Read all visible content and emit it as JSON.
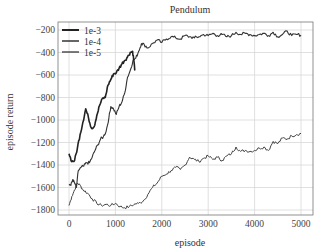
{
  "chart_data": {
    "type": "line",
    "title": "Pendulum",
    "xlabel": "episode",
    "ylabel": "episode return",
    "xlim": [
      -200,
      5300
    ],
    "ylim": [
      -1880,
      -150
    ],
    "xticks": [
      0,
      1000,
      2000,
      3000,
      4000,
      5000
    ],
    "yticks": [
      -200,
      -400,
      -600,
      -800,
      -1000,
      -1200,
      -1400,
      -1600,
      -1800
    ],
    "grid": true,
    "legend_position": "upper left",
    "series": [
      {
        "name": "1e-3",
        "color": "#222222",
        "width": 1.6,
        "x": [
          0,
          60,
          120,
          180,
          240,
          300,
          360,
          420,
          480,
          540,
          600,
          660,
          720,
          780,
          840,
          900,
          960,
          1020,
          1080,
          1140,
          1200,
          1260,
          1320,
          1370,
          1400,
          1420
        ],
        "y": [
          -1300,
          -1370,
          -1360,
          -1250,
          -1130,
          -1020,
          -900,
          -980,
          -1070,
          -1060,
          -960,
          -870,
          -810,
          -800,
          -690,
          -640,
          -590,
          -580,
          -540,
          -500,
          -470,
          -440,
          -400,
          -390,
          -480,
          -560
        ]
      },
      {
        "name": "1e-4",
        "color": "#333333",
        "width": 1.1,
        "x": [
          0,
          40,
          80,
          120,
          160,
          200,
          260,
          320,
          380,
          440,
          500,
          560,
          620,
          680,
          740,
          800,
          860,
          900,
          960,
          1020,
          1080,
          1140,
          1200,
          1260,
          1320,
          1380,
          1440,
          1500,
          1560,
          1620,
          1700,
          1800,
          1900,
          2000,
          2100,
          2200,
          2300,
          2400,
          2500,
          2600,
          2700,
          2800,
          2900,
          3000,
          3100,
          3200,
          3300,
          3400,
          3500,
          3600,
          3700,
          3800,
          3900,
          4000,
          4100,
          4200,
          4300,
          4400,
          4500,
          4600,
          4700,
          4800,
          4900,
          5000
        ],
        "y": [
          -1570,
          -1580,
          -1530,
          -1560,
          -1600,
          -1450,
          -1420,
          -1410,
          -1380,
          -1380,
          -1330,
          -1270,
          -1220,
          -1170,
          -1150,
          -1100,
          -980,
          -880,
          -900,
          -950,
          -880,
          -840,
          -760,
          -620,
          -560,
          -470,
          -450,
          -390,
          -320,
          -330,
          -360,
          -320,
          -290,
          -310,
          -280,
          -260,
          -270,
          -280,
          -250,
          -260,
          -270,
          -260,
          -240,
          -250,
          -230,
          -250,
          -240,
          -260,
          -250,
          -220,
          -240,
          -230,
          -240,
          -250,
          -240,
          -230,
          -250,
          -220,
          -260,
          -240,
          -210,
          -250,
          -240,
          -245
        ]
      },
      {
        "name": "1e-5",
        "color": "#444444",
        "width": 1.0,
        "x": [
          0,
          60,
          120,
          180,
          240,
          300,
          400,
          500,
          600,
          700,
          800,
          900,
          1000,
          1100,
          1200,
          1300,
          1400,
          1500,
          1600,
          1700,
          1800,
          1900,
          2000,
          2100,
          2200,
          2300,
          2400,
          2500,
          2600,
          2700,
          2800,
          2900,
          3000,
          3100,
          3200,
          3300,
          3400,
          3500,
          3600,
          3700,
          3800,
          3900,
          4000,
          4100,
          4200,
          4300,
          4400,
          4500,
          4600,
          4700,
          4800,
          4900,
          5000
        ],
        "y": [
          -1760,
          -1680,
          -1620,
          -1560,
          -1580,
          -1620,
          -1650,
          -1700,
          -1740,
          -1760,
          -1750,
          -1760,
          -1740,
          -1770,
          -1780,
          -1770,
          -1750,
          -1740,
          -1720,
          -1660,
          -1600,
          -1560,
          -1500,
          -1480,
          -1450,
          -1420,
          -1440,
          -1400,
          -1330,
          -1350,
          -1370,
          -1340,
          -1320,
          -1350,
          -1330,
          -1360,
          -1320,
          -1300,
          -1240,
          -1280,
          -1270,
          -1280,
          -1270,
          -1250,
          -1240,
          -1270,
          -1190,
          -1210,
          -1160,
          -1170,
          -1140,
          -1130,
          -1120
        ]
      }
    ]
  }
}
